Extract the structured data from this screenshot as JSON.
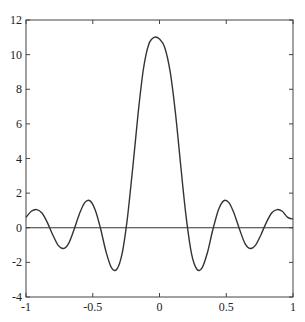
{
  "chart_data": {
    "type": "line",
    "title": "",
    "xlabel": "",
    "ylabel": "",
    "xlim": [
      -1,
      1
    ],
    "ylim": [
      -4,
      12
    ],
    "grid": false,
    "legend": null,
    "xticks": [
      -1,
      -0.5,
      0,
      0.5,
      1
    ],
    "xtick_labels": [
      "-1",
      "-0.5",
      "0",
      "0.5",
      "1"
    ],
    "yticks": [
      -4,
      -2,
      0,
      2,
      4,
      6,
      8,
      10,
      12
    ],
    "ytick_labels": [
      "-4",
      "-2",
      "0",
      "2",
      "4",
      "6",
      "8",
      "10",
      "12"
    ],
    "reference_lines": [
      {
        "axis": "y",
        "value": 0
      }
    ],
    "series": [
      {
        "name": "response",
        "color": "#333333",
        "x": [
          -1,
          -0.96,
          -0.92,
          -0.88,
          -0.84,
          -0.8,
          -0.76,
          -0.72,
          -0.68,
          -0.64,
          -0.6,
          -0.56,
          -0.52,
          -0.48,
          -0.44,
          -0.4,
          -0.36,
          -0.32,
          -0.28,
          -0.24,
          -0.2,
          -0.16,
          -0.12,
          -0.08,
          -0.04,
          0,
          0.04,
          0.08,
          0.12,
          0.16,
          0.2,
          0.24,
          0.28,
          0.32,
          0.36,
          0.4,
          0.44,
          0.48,
          0.52,
          0.56,
          0.6,
          0.64,
          0.68,
          0.72,
          0.76,
          0.8,
          0.84,
          0.88,
          0.92,
          0.96,
          1
        ],
        "y": [
          0.6,
          0.95,
          1.05,
          0.85,
          0.3,
          -0.4,
          -1.0,
          -1.2,
          -0.9,
          -0.1,
          0.8,
          1.45,
          1.55,
          1.0,
          -0.1,
          -1.4,
          -2.3,
          -2.4,
          -1.5,
          0.6,
          3.5,
          6.6,
          9.2,
          10.6,
          11.0,
          10.9,
          10.4,
          9.0,
          6.6,
          3.5,
          0.6,
          -1.5,
          -2.4,
          -2.3,
          -1.4,
          -0.1,
          1.0,
          1.55,
          1.45,
          0.8,
          -0.1,
          -0.9,
          -1.2,
          -1.0,
          -0.4,
          0.3,
          0.85,
          1.05,
          0.95,
          0.6,
          0.5
        ]
      }
    ]
  }
}
